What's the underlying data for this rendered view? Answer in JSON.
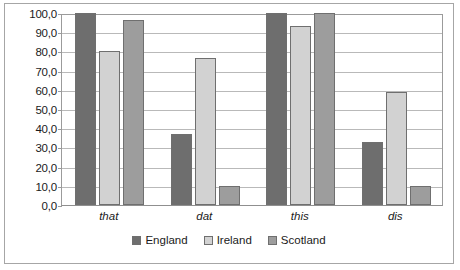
{
  "chart_data": {
    "type": "bar",
    "title": "",
    "xlabel": "",
    "ylabel": "",
    "categories": [
      "that",
      "dat",
      "this",
      "dis"
    ],
    "series": [
      {
        "name": "England",
        "color": "#6e6e6e",
        "values": [
          100.0,
          37.0,
          100.0,
          33.0
        ]
      },
      {
        "name": "Ireland",
        "color": "#d2d2d2",
        "values": [
          80.0,
          76.5,
          93.0,
          59.0
        ]
      },
      {
        "name": "Scotland",
        "color": "#9d9d9d",
        "values": [
          96.5,
          10.0,
          100.0,
          10.0
        ]
      }
    ],
    "ylim": [
      0,
      100
    ],
    "ytick_step": 10,
    "yticks": [
      "0,0",
      "10,0",
      "20,0",
      "30,0",
      "40,0",
      "50,0",
      "60,0",
      "70,0",
      "80,0",
      "90,0",
      "100,0"
    ],
    "ytick_values": [
      0,
      10,
      20,
      30,
      40,
      50,
      60,
      70,
      80,
      90,
      100
    ],
    "grid": true,
    "legend_position": "bottom",
    "bar_border_color": "#6f6f6f",
    "gridline_color": "#b9b9b9",
    "axis_color": "#9b9b9b",
    "frame_color": "#a6a6a6"
  }
}
